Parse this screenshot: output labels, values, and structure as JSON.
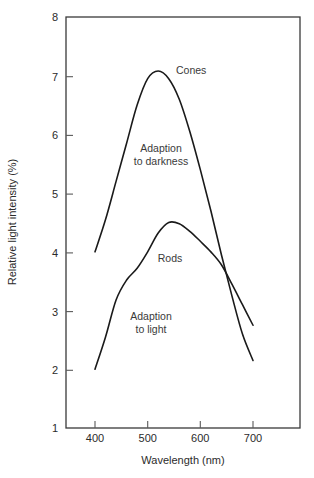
{
  "chart_data": {
    "type": "line",
    "title": "",
    "xlabel": "Wavelength (nm)",
    "ylabel": "Relative light intensity (%)",
    "xlim": [
      380,
      825
    ],
    "ylim": [
      1,
      8
    ],
    "xticks": [
      400,
      500,
      600,
      700
    ],
    "yticks": [
      1,
      2,
      3,
      4,
      5,
      6,
      7,
      8
    ],
    "xtick_labels": [
      "400",
      "500",
      "600",
      "700"
    ],
    "ytick_labels": [
      "1",
      "2",
      "3",
      "4",
      "5",
      "6",
      "7",
      "8"
    ],
    "grid": false,
    "legend": "inline-annotations",
    "series": [
      {
        "name": "Cones",
        "label": "Cones",
        "x": [
          400,
          420,
          440,
          460,
          480,
          500,
          520,
          540,
          560,
          580,
          600,
          620,
          640,
          660,
          680,
          700
        ],
        "y": [
          4.0,
          4.55,
          5.2,
          5.85,
          6.5,
          6.95,
          7.08,
          6.95,
          6.6,
          6.05,
          5.4,
          4.7,
          3.95,
          3.25,
          2.6,
          2.15
        ]
      },
      {
        "name": "Rods",
        "label": "Rods",
        "x": [
          400,
          420,
          440,
          460,
          480,
          500,
          520,
          540,
          560,
          580,
          600,
          620,
          640,
          660,
          680,
          700
        ],
        "y": [
          2.0,
          2.55,
          3.18,
          3.52,
          3.72,
          4.0,
          4.32,
          4.5,
          4.48,
          4.35,
          4.18,
          4.0,
          3.78,
          3.45,
          3.1,
          2.75
        ]
      }
    ],
    "annotations": [
      {
        "text": "Cones",
        "x": 560,
        "y": 7.05
      },
      {
        "text_line1": "Adaption",
        "text_line2": "to darkness",
        "x": 525,
        "y": 5.85
      },
      {
        "text": "Rods",
        "x": 530,
        "y": 4.0
      },
      {
        "text_line1": "Adaption",
        "text_line2": "to light",
        "x": 505,
        "y": 3.05
      }
    ]
  },
  "labels": {
    "cones": "Cones",
    "rods": "Rods",
    "adaption_darkness_line1": "Adaption",
    "adaption_darkness_line2": "to darkness",
    "adaption_light_line1": "Adaption",
    "adaption_light_line2": "to light",
    "x_axis_title": "Wavelength (nm)",
    "y_axis_title": "Relative light intensity (%)",
    "y_8": "8",
    "y_7": "7",
    "y_6": "6",
    "y_5": "5",
    "y_4": "4",
    "y_3": "3",
    "y_2": "2",
    "y_1": "1",
    "x_400": "400",
    "x_500": "500",
    "x_600": "600",
    "x_700": "700"
  },
  "colors": {
    "curve": "#1a1a1a",
    "frame": "#3a3a3a",
    "text": "#2b2b2b",
    "background": "#ffffff"
  }
}
